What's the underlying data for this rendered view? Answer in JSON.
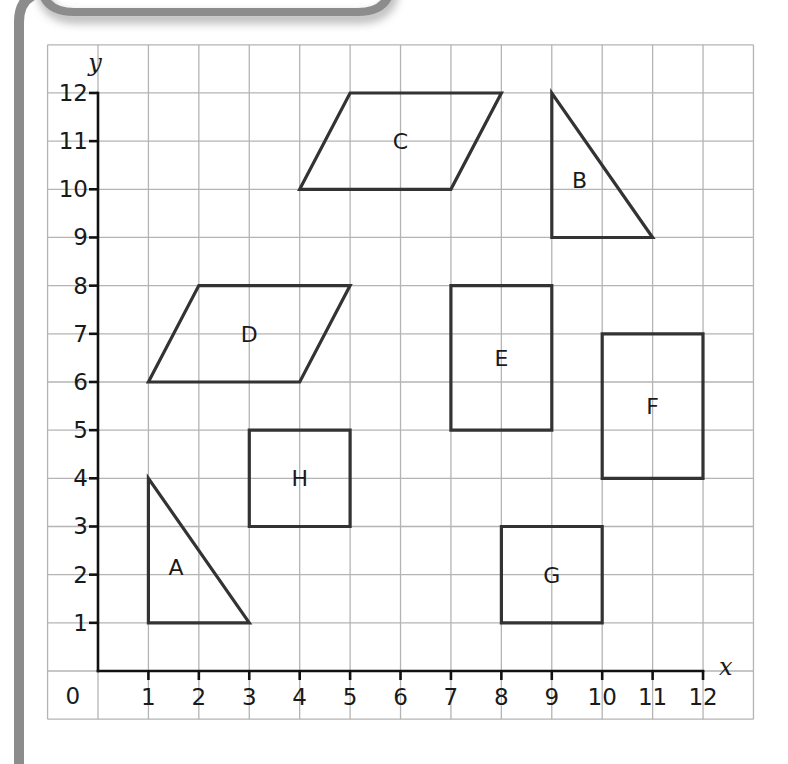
{
  "frame": {
    "border_color": "#8c8c8c",
    "tab": {
      "x1": 40,
      "x2": 392,
      "bottom": 12,
      "radius": 34
    },
    "left_bar": {
      "x": 19,
      "top": 0,
      "bottom": 764
    }
  },
  "grid": {
    "origin_px": {
      "x": 98,
      "y": 671
    },
    "unit_px": {
      "x": 50.42,
      "y": 48.17
    },
    "x_range": [
      -1,
      13
    ],
    "y_range": [
      -1,
      13
    ],
    "line_color": "#b4b4b4"
  },
  "axes": {
    "x_label": "x",
    "y_label": "y",
    "origin_label": "0",
    "x_ticks": [
      "1",
      "2",
      "3",
      "4",
      "5",
      "6",
      "7",
      "8",
      "9",
      "10",
      "11",
      "12"
    ],
    "y_ticks": [
      "1",
      "2",
      "3",
      "4",
      "5",
      "6",
      "7",
      "8",
      "9",
      "10",
      "11",
      "12"
    ],
    "x_max": 12,
    "y_max": 12
  },
  "chart_data": {
    "type": "coordinate-grid",
    "title": "",
    "xlabel": "x",
    "ylabel": "y",
    "xlim": [
      0,
      12
    ],
    "ylim": [
      0,
      12
    ],
    "grid": true,
    "shapes": [
      {
        "name": "A",
        "kind": "right triangle",
        "vertices": [
          [
            1,
            4
          ],
          [
            1,
            1
          ],
          [
            3,
            1
          ]
        ],
        "label_pos": [
          1.55,
          2.15
        ]
      },
      {
        "name": "B",
        "kind": "right triangle",
        "vertices": [
          [
            9,
            12
          ],
          [
            9,
            9
          ],
          [
            11,
            9
          ]
        ],
        "label_pos": [
          9.55,
          10.2
        ]
      },
      {
        "name": "C",
        "kind": "parallelogram",
        "vertices": [
          [
            4,
            10
          ],
          [
            5,
            12
          ],
          [
            8,
            12
          ],
          [
            7,
            10
          ]
        ],
        "label_pos": [
          6,
          11
        ]
      },
      {
        "name": "D",
        "kind": "parallelogram",
        "vertices": [
          [
            1,
            6
          ],
          [
            2,
            8
          ],
          [
            5,
            8
          ],
          [
            4,
            6
          ]
        ],
        "label_pos": [
          3,
          7
        ]
      },
      {
        "name": "E",
        "kind": "rectangle",
        "vertices": [
          [
            7,
            5
          ],
          [
            7,
            8
          ],
          [
            9,
            8
          ],
          [
            9,
            5
          ]
        ],
        "label_pos": [
          8,
          6.5
        ]
      },
      {
        "name": "F",
        "kind": "rectangle",
        "vertices": [
          [
            10,
            4
          ],
          [
            10,
            7
          ],
          [
            12,
            7
          ],
          [
            12,
            4
          ]
        ],
        "label_pos": [
          11,
          5.5
        ]
      },
      {
        "name": "G",
        "kind": "square",
        "vertices": [
          [
            8,
            1
          ],
          [
            8,
            3
          ],
          [
            10,
            3
          ],
          [
            10,
            1
          ]
        ],
        "label_pos": [
          9,
          2
        ]
      },
      {
        "name": "H",
        "kind": "square",
        "vertices": [
          [
            3,
            3
          ],
          [
            3,
            5
          ],
          [
            5,
            5
          ],
          [
            5,
            3
          ]
        ],
        "label_pos": [
          4,
          4
        ]
      }
    ]
  }
}
